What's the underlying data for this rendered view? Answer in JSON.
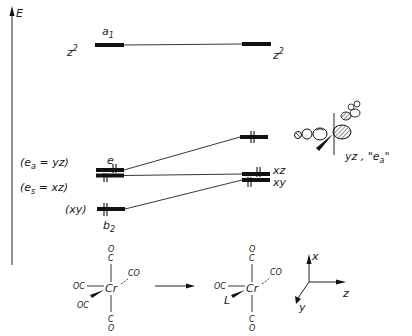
{
  "axis": {
    "label": "E"
  },
  "levels": {
    "a1": {
      "symmetry_label": "a",
      "symmetry_sub": "1",
      "left_orbital": "z",
      "left_sup": "2",
      "right_orbital": "z",
      "right_sup": "2"
    },
    "e": {
      "symmetry_label": "e",
      "left_label_a": "(e",
      "left_label_a_sub": "a",
      "left_label_a_rest": " = yz)",
      "left_label_s": "(e",
      "left_label_s_sub": "s",
      "left_label_s_rest": " = xz)"
    },
    "b2": {
      "symmetry_label": "b",
      "symmetry_sub": "2",
      "left_orbital": "(xy)"
    },
    "right": {
      "upper_orbital_caption": "yz , \"e",
      "upper_orbital_caption_sub": "a",
      "upper_orbital_caption_end": "\"",
      "middle_label": "xz",
      "lower_label": "xy"
    }
  },
  "molecule_left": {
    "center": "Cr",
    "top": [
      "O",
      "C"
    ],
    "bottom": [
      "C",
      "O"
    ],
    "left": "OC",
    "front": "OC",
    "back": "CO"
  },
  "molecule_right": {
    "center": "Cr",
    "top": [
      "O",
      "C"
    ],
    "bottom": [
      "C",
      "O"
    ],
    "left": "OC",
    "front": "L",
    "back": "CO"
  },
  "reaction_arrow": "→",
  "axes": {
    "x": "x",
    "y": "y",
    "z": "z"
  },
  "electrons": {
    "e_pair_count": 2,
    "b2_pair_count": 1
  }
}
